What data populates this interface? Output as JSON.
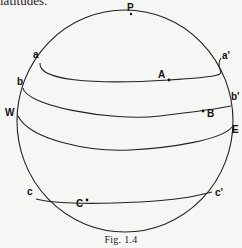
{
  "top_text": "latitudes.",
  "figure": {
    "caption": "Fig. 1.4",
    "labels": {
      "P": "P",
      "a": "a",
      "a_prime": "a'",
      "A": "A",
      "b": "b",
      "b_prime": "b'",
      "B": "B",
      "W": "W",
      "E": "E",
      "c": "c",
      "c_prime": "c'",
      "C": "C"
    },
    "colors": {
      "stroke": "#222222",
      "background": "#f6f6f4"
    }
  }
}
